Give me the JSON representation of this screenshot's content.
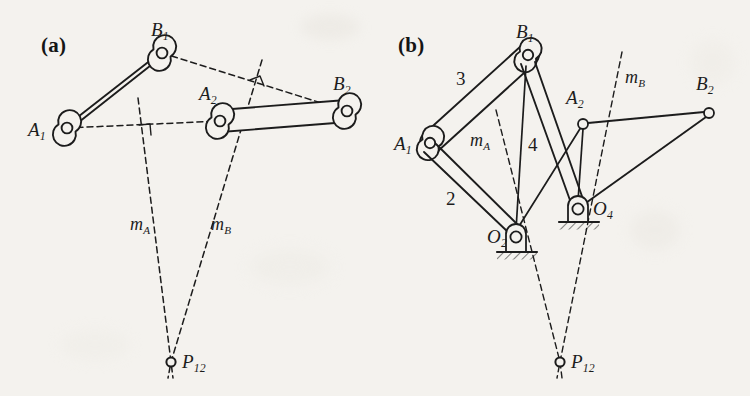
{
  "figure": {
    "background_color": "#f4f2ee",
    "ink_color": "#1c1c1c"
  },
  "panels": [
    {
      "id": "a",
      "label": "(a)",
      "caption": "Two prescribed positions of the coupler with perpendicular bisectors meeting at the pole",
      "joints": [
        {
          "name": "A1",
          "label": "A",
          "sub": "1",
          "x": 67,
          "y": 128
        },
        {
          "name": "B1",
          "label": "B",
          "sub": "1",
          "x": 162,
          "y": 53
        },
        {
          "name": "A2",
          "label": "A",
          "sub": "2",
          "x": 220,
          "y": 121
        },
        {
          "name": "B2",
          "label": "B",
          "sub": "2",
          "x": 347,
          "y": 111
        },
        {
          "name": "P12",
          "label": "P",
          "sub": "12",
          "x": 171,
          "y": 362
        }
      ],
      "bisectors": [
        {
          "name": "mA",
          "label": "m",
          "sub": "A",
          "label_x": 143,
          "label_y": 224
        },
        {
          "name": "mB",
          "label": "m",
          "sub": "B",
          "label_x": 222,
          "label_y": 224
        }
      ],
      "right_angle_marks": [
        {
          "on": "A1A2",
          "x": 145,
          "y": 131
        },
        {
          "on": "B1B2",
          "x": 257,
          "y": 83
        }
      ]
    },
    {
      "id": "b",
      "label": "(b)",
      "caption": "Resulting four-bar linkage with fixed pivots O2 and O4",
      "joints": [
        {
          "name": "A1",
          "label": "A",
          "sub": "1",
          "x": 430,
          "y": 143
        },
        {
          "name": "B1",
          "label": "B",
          "sub": "1",
          "x": 528,
          "y": 55
        },
        {
          "name": "A2",
          "label": "A",
          "sub": "2",
          "x": 583,
          "y": 124
        },
        {
          "name": "B2",
          "label": "B",
          "sub": "2",
          "x": 709,
          "y": 113
        },
        {
          "name": "O2",
          "label": "O",
          "sub": "2",
          "x": 516,
          "y": 237
        },
        {
          "name": "O4",
          "label": "O",
          "sub": "4",
          "x": 578,
          "y": 209
        },
        {
          "name": "P12",
          "label": "P",
          "sub": "12",
          "x": 560,
          "y": 362
        }
      ],
      "links": [
        {
          "number": "2",
          "label_x": 448,
          "label_y": 190
        },
        {
          "number": "3",
          "label_x": 458,
          "label_y": 70
        },
        {
          "number": "4",
          "label_x": 530,
          "label_y": 136
        }
      ],
      "bisectors": [
        {
          "name": "mA",
          "label": "m",
          "sub": "A",
          "label_x": 483,
          "label_y": 140
        },
        {
          "name": "mB",
          "label": "m",
          "sub": "B",
          "label_x": 632,
          "label_y": 77
        }
      ],
      "ground_supports": [
        {
          "at": "O2",
          "x": 516,
          "y": 252
        },
        {
          "at": "O4",
          "x": 578,
          "y": 222
        }
      ]
    }
  ]
}
